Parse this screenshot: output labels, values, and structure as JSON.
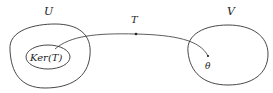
{
  "diagram": {
    "sets": [
      {
        "id": "U",
        "label": "U",
        "role": "domain"
      },
      {
        "id": "V",
        "label": "V",
        "role": "codomain"
      }
    ],
    "subset": {
      "id": "KerT",
      "label": "Ker(T)",
      "parent": "U"
    },
    "mapping": {
      "label": "T",
      "from": "Ker(T)",
      "to": "θ"
    },
    "target_point": {
      "label": "θ",
      "parent": "V"
    },
    "colors": {
      "stroke": "#333333",
      "text": "#222222",
      "background": "#ffffff"
    }
  }
}
